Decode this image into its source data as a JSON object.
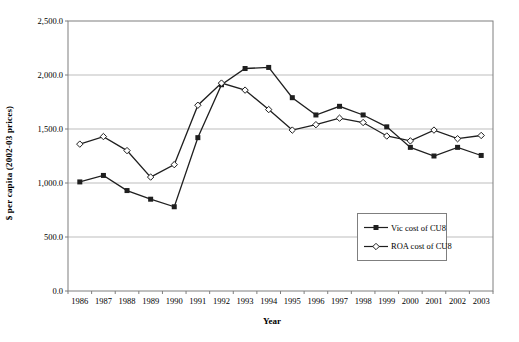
{
  "chart_data": {
    "type": "line",
    "title": "",
    "xlabel": "Year",
    "ylabel": "$ per capita (2002-03 prices)",
    "x": [
      "1986",
      "1987",
      "1988",
      "1989",
      "1990",
      "1991",
      "1992",
      "1993",
      "1994",
      "1995",
      "1996",
      "1997",
      "1998",
      "1999",
      "2000",
      "2001",
      "2002",
      "2003"
    ],
    "ylim": [
      0,
      2500
    ],
    "grid": true,
    "legend_position": "inside-right-lower",
    "yticks": [
      {
        "value": 0,
        "label": "0.0"
      },
      {
        "value": 500,
        "label": "500.0"
      },
      {
        "value": 1000,
        "label": "1,000.0"
      },
      {
        "value": 1500,
        "label": "1,500.0"
      },
      {
        "value": 2000,
        "label": "2,000.0"
      },
      {
        "value": 2500,
        "label": "2,500.0"
      }
    ],
    "series": [
      {
        "name": "Vic cost of CU8",
        "marker": "filled-square",
        "color": "#1f1f1f",
        "values": [
          1010,
          1070,
          930,
          850,
          780,
          1420,
          1910,
          2060,
          2070,
          1790,
          1630,
          1710,
          1630,
          1520,
          1330,
          1250,
          1330,
          1255
        ]
      },
      {
        "name": "ROA cost of CU8",
        "marker": "open-diamond",
        "color": "#1f1f1f",
        "values": [
          1360,
          1430,
          1300,
          1055,
          1170,
          1720,
          1925,
          1860,
          1680,
          1490,
          1540,
          1600,
          1560,
          1435,
          1390,
          1490,
          1410,
          1440
        ]
      }
    ]
  },
  "colors": {
    "background": "#ffffff",
    "gridline": "#bdbdbd",
    "plot_border": "#7f7f7f",
    "text": "#000000"
  }
}
